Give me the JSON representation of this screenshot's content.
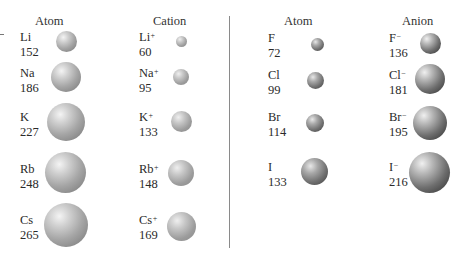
{
  "headers": {
    "left_atom": "Atom",
    "cation": "Cation",
    "right_atom": "Atom",
    "anion": "Anion"
  },
  "alkali_atoms": [
    {
      "symbol": "Li",
      "radius": "152"
    },
    {
      "symbol": "Na",
      "radius": "186"
    },
    {
      "symbol": "K",
      "radius": "227"
    },
    {
      "symbol": "Rb",
      "radius": "248"
    },
    {
      "symbol": "Cs",
      "radius": "265"
    }
  ],
  "cations": [
    {
      "symbol": "Li",
      "charge": "+",
      "radius": "60"
    },
    {
      "symbol": "Na",
      "charge": "+",
      "radius": "95"
    },
    {
      "symbol": "K",
      "charge": "+",
      "radius": "133"
    },
    {
      "symbol": "Rb",
      "charge": "+",
      "radius": "148"
    },
    {
      "symbol": "Cs",
      "charge": "+",
      "radius": "169"
    }
  ],
  "halogen_atoms": [
    {
      "symbol": "F",
      "radius": "72"
    },
    {
      "symbol": "Cl",
      "radius": "99"
    },
    {
      "symbol": "Br",
      "radius": "114"
    },
    {
      "symbol": "I",
      "radius": "133"
    }
  ],
  "anions": [
    {
      "symbol": "F",
      "charge": "−",
      "radius": "136"
    },
    {
      "symbol": "Cl",
      "charge": "−",
      "radius": "181"
    },
    {
      "symbol": "Br",
      "charge": "−",
      "radius": "195"
    },
    {
      "symbol": "I",
      "charge": "−",
      "radius": "216"
    }
  ]
}
